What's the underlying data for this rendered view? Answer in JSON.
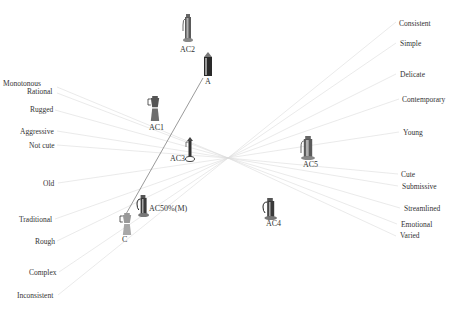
{
  "diagram": {
    "type": "semantic perceptual map",
    "center": {
      "x": 228,
      "y": 158
    },
    "line_color": "#dcdcdc",
    "label_color": "#333333",
    "left_terms": [
      {
        "text": "Monotonous",
        "x": 3,
        "y": 86,
        "lx": 57,
        "ly": 87
      },
      {
        "text": "Rational",
        "x": 27,
        "y": 94,
        "lx": 57,
        "ly": 93
      },
      {
        "text": "Rugged",
        "x": 30,
        "y": 112,
        "lx": 55,
        "ly": 110
      },
      {
        "text": "Aggressive",
        "x": 20,
        "y": 134,
        "lx": 57,
        "ly": 131
      },
      {
        "text": "Not cute",
        "x": 29,
        "y": 148,
        "lx": 57,
        "ly": 145
      },
      {
        "text": "Old",
        "x": 43,
        "y": 186,
        "lx": 58,
        "ly": 183
      },
      {
        "text": "Traditional",
        "x": 19,
        "y": 222,
        "lx": 55,
        "ly": 219
      },
      {
        "text": "Rough",
        "x": 35,
        "y": 244,
        "lx": 57,
        "ly": 241
      },
      {
        "text": "Complex",
        "x": 29,
        "y": 275,
        "lx": 59,
        "ly": 272
      },
      {
        "text": "Inconsistent",
        "x": 17,
        "y": 298,
        "lx": 58,
        "ly": 295
      }
    ],
    "right_terms": [
      {
        "text": "Consistent",
        "x": 399,
        "y": 26,
        "lx": 396,
        "ly": 22
      },
      {
        "text": "Simple",
        "x": 400,
        "y": 46,
        "lx": 396,
        "ly": 43
      },
      {
        "text": "Delicate",
        "x": 400,
        "y": 77,
        "lx": 396,
        "ly": 74
      },
      {
        "text": "Contemporary",
        "x": 402,
        "y": 102,
        "lx": 399,
        "ly": 99
      },
      {
        "text": "Young",
        "x": 403,
        "y": 135,
        "lx": 399,
        "ly": 132
      },
      {
        "text": "Cute",
        "x": 401,
        "y": 177,
        "lx": 398,
        "ly": 174
      },
      {
        "text": "Submissive",
        "x": 402,
        "y": 189,
        "lx": 398,
        "ly": 186
      },
      {
        "text": "Streamlined",
        "x": 404,
        "y": 211,
        "lx": 400,
        "ly": 208
      },
      {
        "text": "Emotional",
        "x": 401,
        "y": 227,
        "lx": 397,
        "ly": 224
      },
      {
        "text": "Varied",
        "x": 400,
        "y": 238,
        "lx": 396,
        "ly": 236
      }
    ],
    "products": [
      {
        "id": "AC2",
        "label": "AC2",
        "x": 183,
        "y": 14,
        "w": 10,
        "h": 28,
        "lx": 180,
        "ly": 52,
        "style": "tall-gray"
      },
      {
        "id": "A",
        "label": "A",
        "x": 204,
        "y": 52,
        "w": 8,
        "h": 24,
        "lx": 205,
        "ly": 84,
        "style": "tall-dark"
      },
      {
        "id": "AC1",
        "label": "AC1",
        "x": 148,
        "y": 96,
        "w": 14,
        "h": 25,
        "lx": 149,
        "ly": 130,
        "style": "moka"
      },
      {
        "id": "AC3",
        "label": "AC3",
        "x": 185,
        "y": 137,
        "w": 10,
        "h": 25,
        "lx": 170,
        "ly": 161,
        "style": "slim"
      },
      {
        "id": "AC5",
        "label": "AC5",
        "x": 301,
        "y": 136,
        "w": 14,
        "h": 24,
        "lx": 303,
        "ly": 167,
        "style": "tall-gray"
      },
      {
        "id": "AC50M",
        "label": "AC50%(M)",
        "x": 137,
        "y": 195,
        "w": 12,
        "h": 22,
        "lx": 149,
        "ly": 211,
        "style": "pitcher-dark"
      },
      {
        "id": "C",
        "label": "C",
        "x": 120,
        "y": 213,
        "w": 14,
        "h": 22,
        "lx": 122,
        "ly": 242,
        "style": "moka-light"
      },
      {
        "id": "AC4",
        "label": "AC4",
        "x": 263,
        "y": 198,
        "w": 14,
        "h": 22,
        "lx": 266,
        "ly": 226,
        "style": "pitcher-dark"
      }
    ],
    "ac_axis": {
      "from": "A",
      "to": "C",
      "x1": 203,
      "y1": 78,
      "x2": 126,
      "y2": 214,
      "color": "#555555"
    }
  }
}
